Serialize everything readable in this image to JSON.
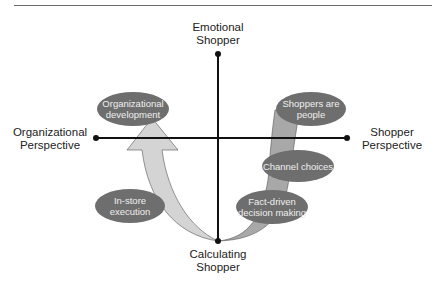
{
  "diagram": {
    "axes": {
      "top": {
        "line1": "Emotional",
        "line2": "Shopper"
      },
      "bottom": {
        "line1": "Calculating",
        "line2": "Shopper"
      },
      "left": {
        "line1": "Organizational",
        "line2": "Perspective"
      },
      "right": {
        "line1": "Shopper",
        "line2": "Perspective"
      }
    },
    "nodes": [
      {
        "id": "org-dev",
        "line1": "Organizational",
        "line2": "development"
      },
      {
        "id": "in-store",
        "line1": "In-store",
        "line2": "execution"
      },
      {
        "id": "shoppers-people",
        "line1": "Shoppers are",
        "line2": "people"
      },
      {
        "id": "channel",
        "line1": "Channel choices",
        "line2": ""
      },
      {
        "id": "fact-driven",
        "line1": "Fact-driven",
        "line2": "decision making"
      }
    ],
    "colors": {
      "oval_fill": "#6e6e6e",
      "left_arrow_fill": "#d4d4d4",
      "right_arrow_fill": "#a8a8a8",
      "axis": "#111111"
    }
  }
}
